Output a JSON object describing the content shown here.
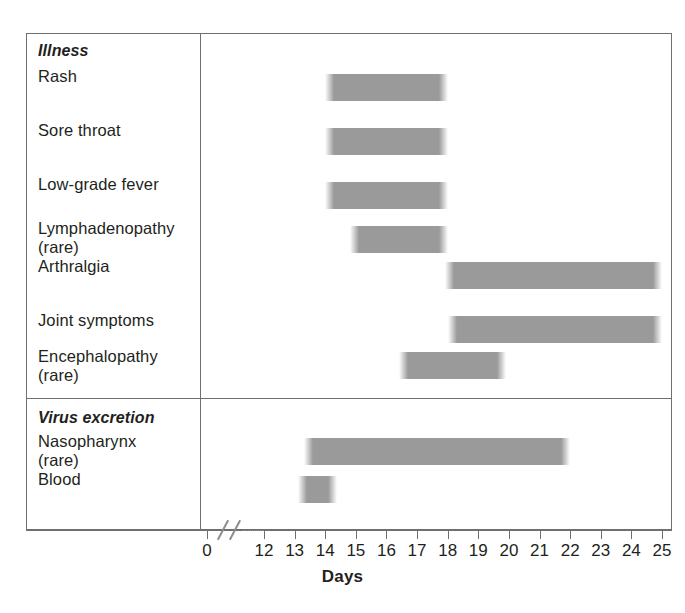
{
  "chart_data": {
    "type": "bar",
    "orientation": "horizontal-timeline",
    "title": "",
    "xlabel": "Days",
    "ylabel": "",
    "xlim": [
      12,
      25
    ],
    "axis_break": {
      "before": 0,
      "resume": 12,
      "note": "axis break between day 0 and day 12"
    },
    "grid": false,
    "legend": null,
    "xticks": [
      "0",
      "12",
      "13",
      "14",
      "15",
      "16",
      "17",
      "18",
      "19",
      "20",
      "21",
      "22",
      "23",
      "24",
      "25"
    ],
    "bar_color": "#9a9a9a",
    "groups": [
      {
        "name": "Illness",
        "rows": [
          {
            "label": "Rash",
            "sub": "",
            "start": 14.0,
            "end": 18.0
          },
          {
            "label": "Sore throat",
            "sub": "",
            "start": 14.0,
            "end": 18.0
          },
          {
            "label": "Low-grade fever",
            "sub": "",
            "start": 14.0,
            "end": 18.0
          },
          {
            "label": "Lymphadenopathy",
            "sub": "(rare)",
            "start": 14.8,
            "end": 18.0
          },
          {
            "label": "Arthralgia",
            "sub": "",
            "start": 17.9,
            "end": 25.0
          },
          {
            "label": "Joint symptoms",
            "sub": "",
            "start": 18.0,
            "end": 25.0
          },
          {
            "label": "Encephalopathy",
            "sub": "(rare)",
            "start": 16.4,
            "end": 19.9
          }
        ]
      },
      {
        "name": "Virus excretion",
        "rows": [
          {
            "label": "Nasopharynx",
            "sub": "(rare)",
            "start": 13.3,
            "end": 22.0
          },
          {
            "label": "Blood",
            "sub": "",
            "start": 13.1,
            "end": 14.4
          }
        ]
      }
    ]
  },
  "labels": {
    "group_illness": "Illness",
    "group_virus": "Virus excretion",
    "rash": "Rash",
    "sore_throat": "Sore throat",
    "low_grade_fever": "Low-grade fever",
    "lymphadenopathy": "Lymphadenopathy",
    "lymphadenopathy_sub": "(rare)",
    "arthralgia": "Arthralgia",
    "joint_symptoms": "Joint symptoms",
    "encephalopathy": "Encephalopathy",
    "encephalopathy_sub": "(rare)",
    "nasopharynx": "Nasopharynx",
    "nasopharynx_sub": "(rare)",
    "blood": "Blood"
  },
  "axis": {
    "title": "Days",
    "ticks": [
      "0",
      "12",
      "13",
      "14",
      "15",
      "16",
      "17",
      "18",
      "19",
      "20",
      "21",
      "22",
      "23",
      "24",
      "25"
    ]
  }
}
